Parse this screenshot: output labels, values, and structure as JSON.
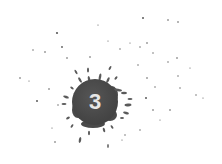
{
  "badge": {
    "number": "3",
    "blob_color": "#474747",
    "text_color": "#e6e6e6",
    "background": "#ffffff"
  }
}
